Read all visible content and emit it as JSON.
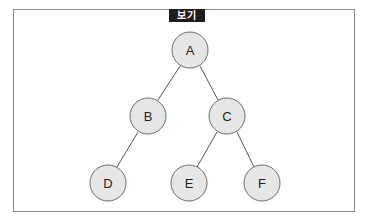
{
  "tag": {
    "label": "보기"
  },
  "colors": {
    "node_fill": "#e6e6e6",
    "node_stroke": "#6e6e6e",
    "edge": "#555555",
    "tag_bg": "#1e1e1e"
  },
  "tree": {
    "nodes": [
      {
        "id": "A",
        "label": "A",
        "x": 190,
        "y": 50
      },
      {
        "id": "B",
        "label": "B",
        "x": 148,
        "y": 116
      },
      {
        "id": "C",
        "label": "C",
        "x": 227,
        "y": 116
      },
      {
        "id": "D",
        "label": "D",
        "x": 108,
        "y": 183
      },
      {
        "id": "E",
        "label": "E",
        "x": 189,
        "y": 183
      },
      {
        "id": "F",
        "label": "F",
        "x": 262,
        "y": 183
      }
    ],
    "edges": [
      {
        "from": "A",
        "to": "B"
      },
      {
        "from": "A",
        "to": "C"
      },
      {
        "from": "B",
        "to": "D"
      },
      {
        "from": "C",
        "to": "E"
      },
      {
        "from": "C",
        "to": "F"
      }
    ],
    "radius": 18
  }
}
